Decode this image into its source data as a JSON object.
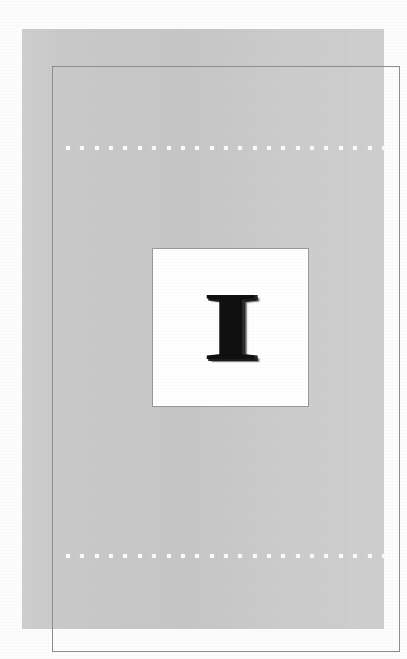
{
  "document": {
    "kind": "printed-letter-card-page",
    "background_color": "#fdfdfd"
  },
  "page": {
    "name": "gray-page-panel",
    "fill_color": "#c9c9c9",
    "rule_color": "#8e8e8e"
  },
  "perforation": {
    "dot_color": "#fbfbfb",
    "dot_count": 23,
    "rows": [
      {
        "id": "top",
        "label": "top-dotted-row"
      },
      {
        "id": "bottom",
        "label": "bottom-dotted-row"
      }
    ]
  },
  "card": {
    "name": "letter-card",
    "background_color": "#ffffff",
    "border_color": "#9a9a9a",
    "letter": "I",
    "letter_color": "#101010",
    "shadow_color": "#1c1c1c"
  }
}
